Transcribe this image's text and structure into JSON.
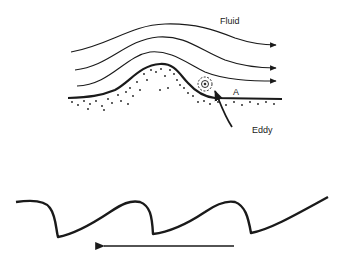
{
  "figure": {
    "top_panel": {
      "description": "Fluid flow over a ripple crest with eddy formed on lee side",
      "labels": {
        "fluid": "Fluid",
        "point": "A",
        "eddy": "Eddy"
      },
      "streamline_count": 3
    },
    "bottom_panel": {
      "description": "Asymmetric ripple profile with flow direction arrow pointing left",
      "ripple_count": 3,
      "arrow_direction": "left"
    },
    "colors": {
      "ink": "#1a1a1a",
      "background": "#ffffff"
    }
  }
}
